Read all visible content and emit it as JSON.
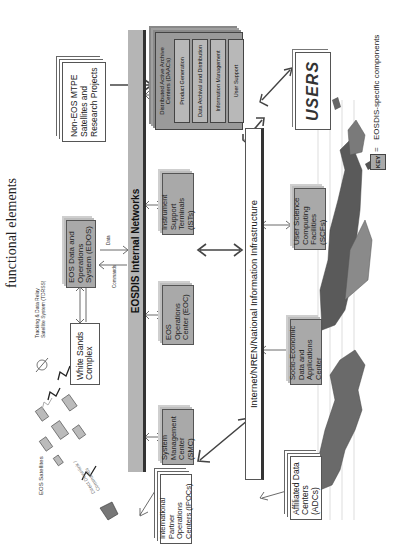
{
  "title": "functional elements",
  "space_segment": {
    "eos_satellites_label": "EOS Satellites",
    "tdrss_label": "Tracking & Data Relay Satellite System (TDRSS)",
    "white_sands": "White Sands Complex",
    "edos": "EOS Data and Operations System (EDOS)",
    "edos_arrow_out": "Data",
    "edos_arrow_in": "Commands",
    "ground_link_label": "Direct Downlink / Commands"
  },
  "non_eos": "Non-EOS MTPE Satellites and Research Projects",
  "internal_network": "EOSDIS Internal Networks",
  "eosdis_boxes": [
    {
      "id": "smc",
      "label": "System Management Center (SMC)"
    },
    {
      "id": "eoc",
      "label": "EOS Operations Center (EOC)"
    },
    {
      "id": "ist",
      "label": "Instrument Support Terminals (ISTs)"
    },
    {
      "id": "qc",
      "label": "Quality Control Science Computing Facilities (QC SCFs)"
    }
  ],
  "daac": {
    "title": "Distributed Active Archive Centers (DAACs)",
    "items": [
      "Product Generation",
      "Data Archival and Distribution",
      "Information Management",
      "User Support"
    ]
  },
  "external_network": "Internet/NREN/National Information Infrastructure",
  "external": {
    "users": "USERS",
    "user_scfs": "User Science Computing Facilities (SCFs)",
    "sedac": "Socio-Economic Data and Applications Center",
    "adcs": "Affiliated Data Centers (ADCs)",
    "ipocs": "International Partner Operations Centers (IPOCs)"
  },
  "key": {
    "badge": "KEY",
    "equals": "=",
    "description": "EOSDIS-specific components"
  },
  "colors": {
    "component_gray": "#a9a9a9",
    "band_gray": "#b5b5b5",
    "outline": "#555555"
  }
}
